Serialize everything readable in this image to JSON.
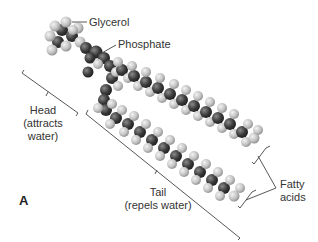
{
  "figure": {
    "panel_label": "A",
    "labels": {
      "glycerol": "Glycerol",
      "phosphate": "Phosphate",
      "head_line1": "Head",
      "head_line2": "(attracts",
      "head_line3": "water)",
      "tail_line1": "Tail",
      "tail_line2": "(repels water)",
      "fatty_line1": "Fatty",
      "fatty_line2": "acids"
    },
    "colors": {
      "carbon": "#3a3a3a",
      "hydrogen": "#c8c8c8",
      "line": "#444444",
      "background": "#ffffff"
    }
  }
}
